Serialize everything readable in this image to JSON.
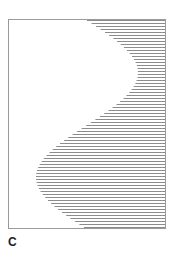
{
  "panel": {
    "label": "C"
  },
  "figure": {
    "frame": {
      "left": 8,
      "top": 19,
      "right": 166,
      "bottom": 229,
      "stroke": "#9a9a9a"
    },
    "hatch": {
      "line_color": "#8c8c8c",
      "line_width": 1,
      "y_start": 20,
      "y_end": 228,
      "spacing": 3,
      "right_x": 165,
      "curve": {
        "type": "sine",
        "center_x": 87,
        "amplitude": 51,
        "period_px": 209,
        "phase_origin_y": 20,
        "description": "S-shaped boundary: hatched region lies right of curve"
      }
    }
  }
}
